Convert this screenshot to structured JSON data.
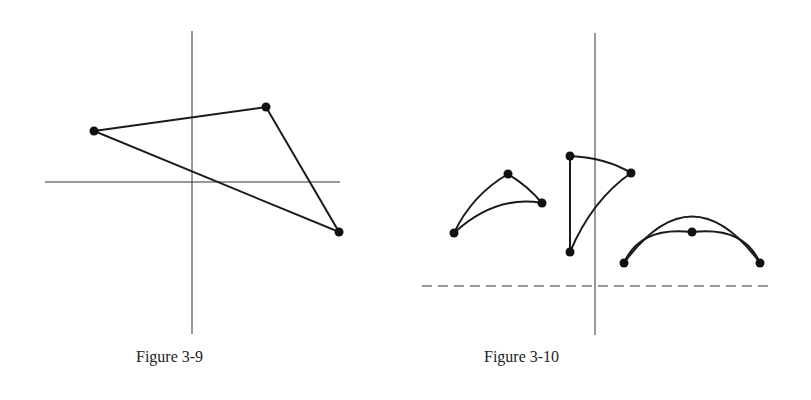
{
  "figures": [
    {
      "caption": "Figure 3-9",
      "description": "Triangle with three vertices over a pair of crossing axes",
      "axes": {
        "vertical": {
          "x": 192,
          "y1": 31,
          "y2": 334
        },
        "horizontal": {
          "y": 182,
          "x1": 45,
          "x2": 340
        }
      },
      "points": [
        [
          94,
          131
        ],
        [
          266,
          107
        ],
        [
          339,
          232
        ]
      ]
    },
    {
      "caption": "Figure 3-10",
      "description": "Three curved triangular shapes above a dashed horizontal line, crossed by a vertical line",
      "axes": {
        "vertical": {
          "x": 595,
          "y1": 33,
          "y2": 335
        },
        "dashed_horizontal": {
          "y": 286,
          "x1": 422,
          "x2": 771
        }
      },
      "shapes": [
        {
          "points": [
            [
              454,
              233
            ],
            [
              508,
              174
            ],
            [
              542,
              203
            ]
          ]
        },
        {
          "points": [
            [
              570,
              156
            ],
            [
              631,
              173
            ],
            [
              570,
              252
            ]
          ]
        },
        {
          "points": [
            [
              624,
              263
            ],
            [
              692,
              232
            ],
            [
              760,
              263
            ]
          ]
        }
      ]
    }
  ],
  "colors": {
    "stroke": "#1a1a1a",
    "axis": "#333333"
  }
}
